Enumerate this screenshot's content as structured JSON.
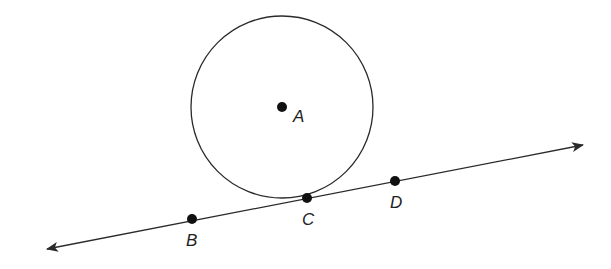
{
  "diagram": {
    "type": "geometry",
    "colors": {
      "stroke": "#2a2a2a",
      "point": "#111111",
      "background": "#ffffff"
    },
    "circle": {
      "center_label": "A",
      "cx": 282,
      "cy": 107,
      "r": 91
    },
    "line": {
      "x1": 47,
      "y1": 249,
      "x2": 583,
      "y2": 145,
      "arrows": "both"
    },
    "points": [
      {
        "label": "A",
        "x": 282,
        "y": 107,
        "label_x": 293,
        "label_y": 122
      },
      {
        "label": "B",
        "x": 192,
        "y": 219,
        "label_x": 186,
        "label_y": 246
      },
      {
        "label": "C",
        "x": 307,
        "y": 198,
        "label_x": 302,
        "label_y": 225
      },
      {
        "label": "D",
        "x": 395,
        "y": 181,
        "label_x": 390,
        "label_y": 208
      }
    ]
  }
}
